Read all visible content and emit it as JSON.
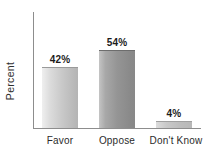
{
  "chart_data": {
    "type": "bar",
    "title": "",
    "subtitle": "",
    "xlabel": "",
    "ylabel": "Percent",
    "categories": [
      "Favor",
      "Oppose",
      "Don't Know"
    ],
    "values": [
      42,
      54,
      4
    ],
    "value_labels": [
      "42%",
      "54%",
      "4%"
    ],
    "ylim": [
      0,
      81
    ],
    "grid": false,
    "legend": null,
    "orientation": "vertical",
    "series": [
      {
        "name": "Percent",
        "values": [
          42,
          54,
          4
        ]
      }
    ],
    "bar_colors": [
      "#cccccc",
      "#969696",
      "#c4c4c4"
    ],
    "axis_color": "#8d8d8d",
    "background": "#ffffff",
    "text_color": "#2b2b2b"
  },
  "axis": {
    "y_title": "Percent"
  },
  "bars": [
    {
      "category": "Favor",
      "value_label": "42%"
    },
    {
      "category": "Oppose",
      "value_label": "54%"
    },
    {
      "category": "Don't Know",
      "value_label": "4%"
    }
  ]
}
